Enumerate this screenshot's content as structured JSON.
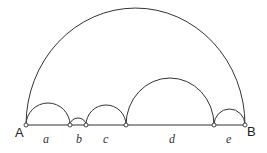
{
  "diagram": {
    "endpoints": {
      "left": "A",
      "right": "B"
    },
    "segments": [
      {
        "label": "a"
      },
      {
        "label": "b"
      },
      {
        "label": "c"
      },
      {
        "label": "d"
      },
      {
        "label": "e"
      }
    ]
  }
}
